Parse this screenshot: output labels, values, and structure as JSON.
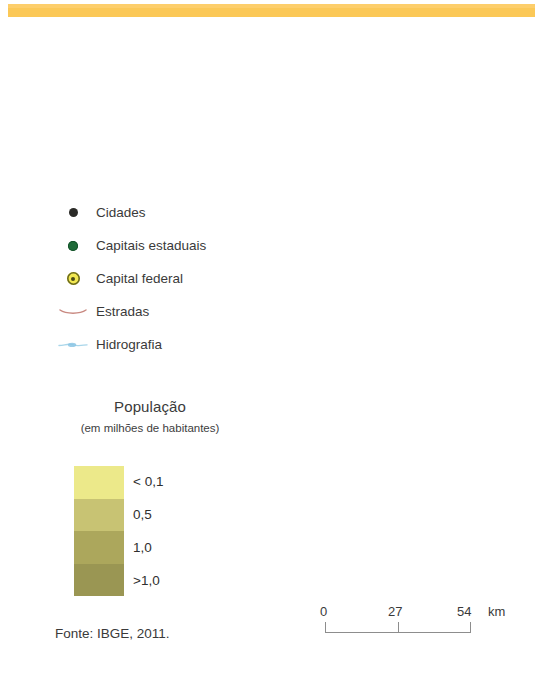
{
  "top_bar": {
    "color": "#fbc857"
  },
  "legend": {
    "items": [
      {
        "label": "Cidades",
        "icon": "black-dot-icon",
        "color": "#2b2b28"
      },
      {
        "label": "Capitais estaduais",
        "icon": "green-dot-icon",
        "color": "#1f6b39"
      },
      {
        "label": "Capital federal",
        "icon": "yellow-target-icon",
        "color": "#f2e851"
      },
      {
        "label": "Estradas",
        "icon": "road-line-icon",
        "color": "#c98a82"
      },
      {
        "label": "Hidrografia",
        "icon": "river-line-icon",
        "color": "#9ccfe8"
      }
    ]
  },
  "population": {
    "title": "População",
    "subtitle": "(em milhões de habitantes)",
    "bands": [
      {
        "label": "< 0,1",
        "color": "#ece98a"
      },
      {
        "label": "0,5",
        "color": "#c8c373"
      },
      {
        "label": "1,0",
        "color": "#aca75c"
      },
      {
        "label": ">1,0",
        "color": "#9a9653"
      }
    ]
  },
  "scalebar": {
    "ticks": [
      "0",
      "27",
      "54"
    ],
    "unit": "km"
  },
  "source": {
    "text": "Fonte: IBGE, 2011."
  }
}
